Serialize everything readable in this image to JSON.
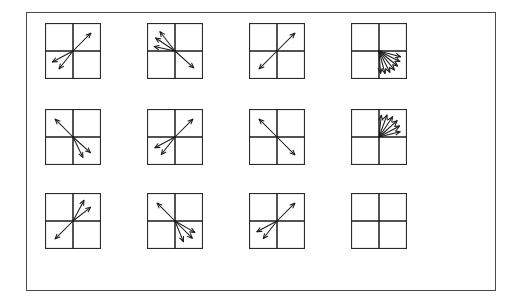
{
  "figure": {
    "rows": 3,
    "columns": 4,
    "panel_count": 12,
    "colors": {
      "background": "#ffffff",
      "frame_border": "#4a4a4a",
      "panel_border": "#2b2b2b",
      "axis": "#1a1a1a",
      "vector": "#1a1a1a"
    },
    "geometry": {
      "frame_left": 26,
      "frame_top": 12,
      "frame_width": 470,
      "frame_height": 279,
      "panel_size": 56,
      "column_x": [
        44,
        146,
        248,
        350
      ],
      "row_y": [
        22,
        108,
        192
      ]
    }
  },
  "chart_data": {
    "type": "scatter",
    "xlabel": "",
    "ylabel": "",
    "layout": {
      "rows": 3,
      "cols": 4,
      "grid": true,
      "legend": false
    },
    "axis_ranges": {
      "x": [
        -1,
        1
      ],
      "y": [
        -1,
        1
      ]
    },
    "panels": [
      {
        "id": "panel-r1c1",
        "row": 1,
        "col": 1,
        "arrow_count": 3,
        "label": "Row 1, Column 1",
        "arrows": [
          {
            "angle_deg": 45,
            "length": 0.95
          },
          {
            "angle_deg": 208,
            "length": 0.88
          },
          {
            "angle_deg": 232,
            "length": 0.85
          }
        ]
      },
      {
        "id": "panel-r1c2",
        "row": 1,
        "col": 2,
        "arrow_count": 4,
        "label": "Row 1, Column 2",
        "arrows": [
          {
            "angle_deg": 128,
            "length": 0.92
          },
          {
            "angle_deg": 146,
            "length": 0.88
          },
          {
            "angle_deg": 168,
            "length": 0.8
          },
          {
            "angle_deg": 318,
            "length": 0.95
          }
        ]
      },
      {
        "id": "panel-r1c3",
        "row": 1,
        "col": 3,
        "arrow_count": 2,
        "label": "Row 1, Column 3",
        "arrows": [
          {
            "angle_deg": 45,
            "length": 0.95
          },
          {
            "angle_deg": 225,
            "length": 0.95
          }
        ]
      },
      {
        "id": "panel-r1c4",
        "row": 1,
        "col": 4,
        "arrow_count": 7,
        "label": "Row 1, Column 4",
        "arrows": [
          {
            "angle_deg": 274,
            "length": 0.84
          },
          {
            "angle_deg": 285,
            "length": 0.88
          },
          {
            "angle_deg": 297,
            "length": 0.9
          },
          {
            "angle_deg": 309,
            "length": 0.92
          },
          {
            "angle_deg": 321,
            "length": 0.9
          },
          {
            "angle_deg": 333,
            "length": 0.88
          },
          {
            "angle_deg": 345,
            "length": 0.84
          }
        ]
      },
      {
        "id": "panel-r2c1",
        "row": 2,
        "col": 1,
        "arrow_count": 3,
        "label": "Row 2, Column 1",
        "arrows": [
          {
            "angle_deg": 135,
            "length": 0.95
          },
          {
            "angle_deg": 318,
            "length": 0.88
          },
          {
            "angle_deg": 296,
            "length": 0.85
          }
        ]
      },
      {
        "id": "panel-r2c2",
        "row": 2,
        "col": 2,
        "arrow_count": 3,
        "label": "Row 2, Column 2",
        "arrows": [
          {
            "angle_deg": 45,
            "length": 0.95
          },
          {
            "angle_deg": 208,
            "length": 0.86
          },
          {
            "angle_deg": 232,
            "length": 0.84
          }
        ]
      },
      {
        "id": "panel-r2c3",
        "row": 2,
        "col": 3,
        "arrow_count": 2,
        "label": "Row 2, Column 3",
        "arrows": [
          {
            "angle_deg": 135,
            "length": 0.95
          },
          {
            "angle_deg": 315,
            "length": 0.95
          }
        ]
      },
      {
        "id": "panel-r2c4",
        "row": 2,
        "col": 4,
        "arrow_count": 6,
        "label": "Row 2, Column 4",
        "arrows": [
          {
            "angle_deg": 14,
            "length": 0.82
          },
          {
            "angle_deg": 28,
            "length": 0.88
          },
          {
            "angle_deg": 42,
            "length": 0.92
          },
          {
            "angle_deg": 56,
            "length": 0.92
          },
          {
            "angle_deg": 70,
            "length": 0.88
          },
          {
            "angle_deg": 84,
            "length": 0.82
          }
        ]
      },
      {
        "id": "panel-r3c1",
        "row": 3,
        "col": 1,
        "arrow_count": 3,
        "label": "Row 3, Column 1",
        "arrows": [
          {
            "angle_deg": 62,
            "length": 0.88
          },
          {
            "angle_deg": 38,
            "length": 0.84
          },
          {
            "angle_deg": 225,
            "length": 0.95
          }
        ]
      },
      {
        "id": "panel-r3c2",
        "row": 3,
        "col": 2,
        "arrow_count": 4,
        "label": "Row 3, Column 2",
        "arrows": [
          {
            "angle_deg": 135,
            "length": 0.95
          },
          {
            "angle_deg": 330,
            "length": 0.86
          },
          {
            "angle_deg": 315,
            "length": 0.92
          },
          {
            "angle_deg": 292,
            "length": 0.84
          }
        ]
      },
      {
        "id": "panel-r3c3",
        "row": 3,
        "col": 3,
        "arrow_count": 3,
        "label": "Row 3, Column 3",
        "arrows": [
          {
            "angle_deg": 45,
            "length": 0.95
          },
          {
            "angle_deg": 208,
            "length": 0.86
          },
          {
            "angle_deg": 232,
            "length": 0.84
          }
        ]
      },
      {
        "id": "panel-r3c4",
        "row": 3,
        "col": 4,
        "arrow_count": 0,
        "label": "Row 3, Column 4",
        "arrows": []
      }
    ]
  }
}
